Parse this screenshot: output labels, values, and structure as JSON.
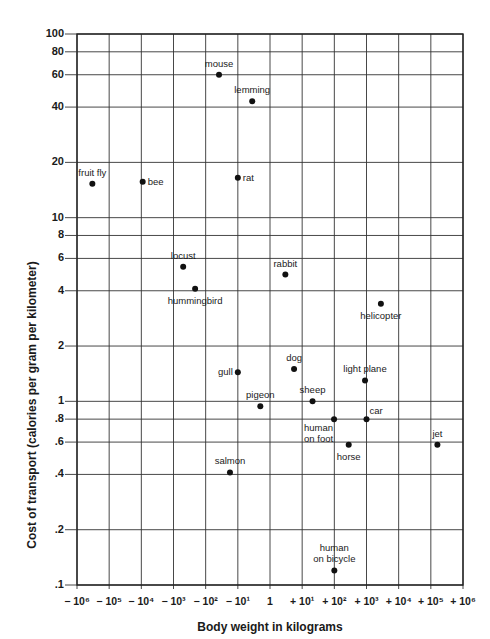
{
  "chart_data": {
    "type": "scatter",
    "title": "",
    "xlabel": "Body weight in kilograms",
    "ylabel": "Cost of transport (calories per gram per kilometer)",
    "xscale": "log",
    "yscale": "log",
    "xlim": [
      1e-06,
      1000000.0
    ],
    "ylim": [
      0.1,
      100
    ],
    "grid": true,
    "x_ticks": [
      {
        "v": -6,
        "label": "− 10⁶"
      },
      {
        "v": -5,
        "label": "− 10⁵"
      },
      {
        "v": -4,
        "label": "− 10⁴"
      },
      {
        "v": -3,
        "label": "− 10³"
      },
      {
        "v": -2,
        "label": "− 10²"
      },
      {
        "v": -1,
        "label": "− 10¹"
      },
      {
        "v": 0,
        "label": "1"
      },
      {
        "v": 1,
        "label": "+ 10¹"
      },
      {
        "v": 2,
        "label": "+ 10²"
      },
      {
        "v": 3,
        "label": "+ 10³"
      },
      {
        "v": 4,
        "label": "+ 10⁴"
      },
      {
        "v": 5,
        "label": "+ 10⁵"
      },
      {
        "v": 6,
        "label": "+ 10⁶"
      }
    ],
    "y_ticks": [
      {
        "v": 100,
        "label": "100"
      },
      {
        "v": 80,
        "label": "80"
      },
      {
        "v": 60,
        "label": "60"
      },
      {
        "v": 40,
        "label": "40"
      },
      {
        "v": 20,
        "label": "20"
      },
      {
        "v": 10,
        "label": "10"
      },
      {
        "v": 8,
        "label": "8"
      },
      {
        "v": 6,
        "label": "6"
      },
      {
        "v": 4,
        "label": "4"
      },
      {
        "v": 2,
        "label": "2"
      },
      {
        "v": 1,
        "label": "1"
      },
      {
        "v": 0.8,
        "label": ".8"
      },
      {
        "v": 0.6,
        "label": ".6"
      },
      {
        "v": 0.4,
        "label": ".4"
      },
      {
        "v": 0.2,
        "label": ".2"
      },
      {
        "v": 0.1,
        "label": ".1"
      }
    ],
    "points": [
      {
        "name": "mouse",
        "x": 0.026,
        "y": 60,
        "label_pos": "above"
      },
      {
        "name": "lemming",
        "x": 0.28,
        "y": 43,
        "label_pos": "above"
      },
      {
        "name": "fruit fly",
        "x": 3e-06,
        "y": 15.3,
        "label_pos": "above"
      },
      {
        "name": "bee",
        "x": 0.00011,
        "y": 15.7,
        "label_pos": "right"
      },
      {
        "name": "rat",
        "x": 0.1,
        "y": 16.5,
        "label_pos": "right"
      },
      {
        "name": "locust",
        "x": 0.002,
        "y": 5.4,
        "label_pos": "above"
      },
      {
        "name": "hummingbird",
        "x": 0.0047,
        "y": 4.1,
        "label_pos": "below"
      },
      {
        "name": "rabbit",
        "x": 3,
        "y": 4.9,
        "label_pos": "above"
      },
      {
        "name": "helicopter",
        "x": 2800,
        "y": 3.4,
        "label_pos": "below"
      },
      {
        "name": "dog",
        "x": 5.6,
        "y": 1.5,
        "label_pos": "above"
      },
      {
        "name": "gull",
        "x": 0.1,
        "y": 1.44,
        "label_pos": "left"
      },
      {
        "name": "light plane",
        "x": 900,
        "y": 1.3,
        "label_pos": "above"
      },
      {
        "name": "pigeon",
        "x": 0.5,
        "y": 0.94,
        "label_pos": "above"
      },
      {
        "name": "sheep",
        "x": 21,
        "y": 1.0,
        "label_pos": "above"
      },
      {
        "name": "human on foot",
        "x": 98,
        "y": 0.8,
        "label_pos": "below-left"
      },
      {
        "name": "car",
        "x": 1000,
        "y": 0.8,
        "label_pos": "above-right"
      },
      {
        "name": "horse",
        "x": 280,
        "y": 0.58,
        "label_pos": "below"
      },
      {
        "name": "jet",
        "x": 160000,
        "y": 0.58,
        "label_pos": "above"
      },
      {
        "name": "salmon",
        "x": 0.057,
        "y": 0.41,
        "label_pos": "above"
      },
      {
        "name": "human on bicycle",
        "x": 100,
        "y": 0.12,
        "label_pos": "above"
      }
    ]
  }
}
